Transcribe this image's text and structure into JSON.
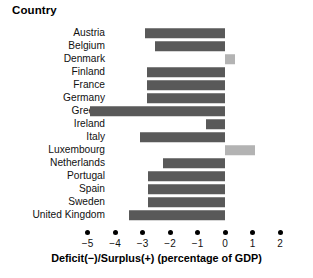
{
  "chart_data": {
    "type": "bar",
    "orientation": "horizontal",
    "title": "Country",
    "xlabel": "Deficit(−)/Surplus(+) (percentage of GDP)",
    "ylabel": "Country",
    "categories": [
      "Austria",
      "Belgium",
      "Denmark",
      "Finland",
      "France",
      "Germany",
      "Greece",
      "Ireland",
      "Italy",
      "Luxembourg",
      "Netherlands",
      "Portugal",
      "Spain",
      "Sweden",
      "United Kingdom"
    ],
    "values": [
      -2.9,
      -2.55,
      0.35,
      -2.85,
      -2.85,
      -2.85,
      -4.9,
      -0.7,
      -3.1,
      1.1,
      -2.25,
      -2.8,
      -2.8,
      -2.8,
      -3.5
    ],
    "xlim": [
      -5.6,
      2.3
    ],
    "xticks": [
      -5,
      -4,
      -3,
      -2,
      -1,
      0,
      1,
      2
    ],
    "xtick_labels": [
      "−5",
      "−4",
      "−3",
      "−2",
      "−1",
      "0",
      "1",
      "2"
    ],
    "grid": false,
    "legend": "none",
    "colors": {
      "negative_bar": "#595959",
      "positive_bar": "#b3b3b3",
      "text": "#111111",
      "background": "#ffffff"
    }
  }
}
